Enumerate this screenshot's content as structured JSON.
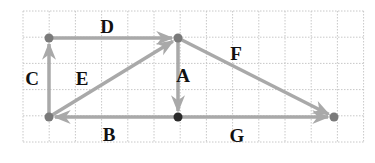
{
  "grid": {
    "x0": 23,
    "y0": 11,
    "cols": 13,
    "rows": 5,
    "cell": 26.2,
    "line_color": "#c8c8c8"
  },
  "colors": {
    "arrow": "#a9a9a9",
    "point_gray": "#7a7a7a",
    "point_dark": "#2a2a2a"
  },
  "points": [
    {
      "id": "P1",
      "x": 49,
      "y": 38,
      "color": "gray"
    },
    {
      "id": "P2",
      "x": 178,
      "y": 38,
      "color": "gray"
    },
    {
      "id": "P3",
      "x": 49,
      "y": 117,
      "color": "gray"
    },
    {
      "id": "P4",
      "x": 178,
      "y": 117,
      "color": "dark"
    },
    {
      "id": "P5",
      "x": 334,
      "y": 117,
      "color": "gray"
    }
  ],
  "vectors": [
    {
      "label": "A",
      "from": "P2",
      "to": "P4",
      "label_x": 183,
      "label_y": 82
    },
    {
      "label": "B",
      "from": "P4",
      "to": "P3",
      "label_x": 109,
      "label_y": 141
    },
    {
      "label": "C",
      "from": "P3",
      "to": "P1",
      "label_x": 32,
      "label_y": 85
    },
    {
      "label": "D",
      "from": "P1",
      "to": "P2",
      "label_x": 107,
      "label_y": 33
    },
    {
      "label": "E",
      "from": "P3",
      "to": "P2",
      "label_x": 82,
      "label_y": 85
    },
    {
      "label": "F",
      "from": "P2",
      "to": "P5",
      "label_x": 236,
      "label_y": 60
    },
    {
      "label": "G",
      "from": "P4",
      "to": "P5",
      "label_x": 237,
      "label_y": 142
    }
  ]
}
